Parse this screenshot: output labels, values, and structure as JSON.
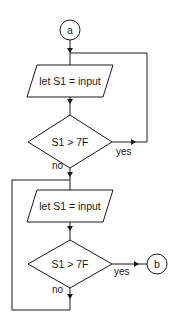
{
  "diagram": {
    "type": "flowchart",
    "connector_start": {
      "label": "a"
    },
    "connector_end": {
      "label": "b"
    },
    "block1": {
      "process": {
        "label": "let S1 = input"
      },
      "decision": {
        "label": "S1 > 7F"
      },
      "yes_label": "yes",
      "no_label": "no"
    },
    "block2": {
      "process": {
        "label": "let S1 = input"
      },
      "decision": {
        "label": "S1 > 7F"
      },
      "yes_label": "yes",
      "no_label": "no"
    },
    "colors": {
      "stroke": "#1a1a1a",
      "background": "#ffffff"
    }
  }
}
